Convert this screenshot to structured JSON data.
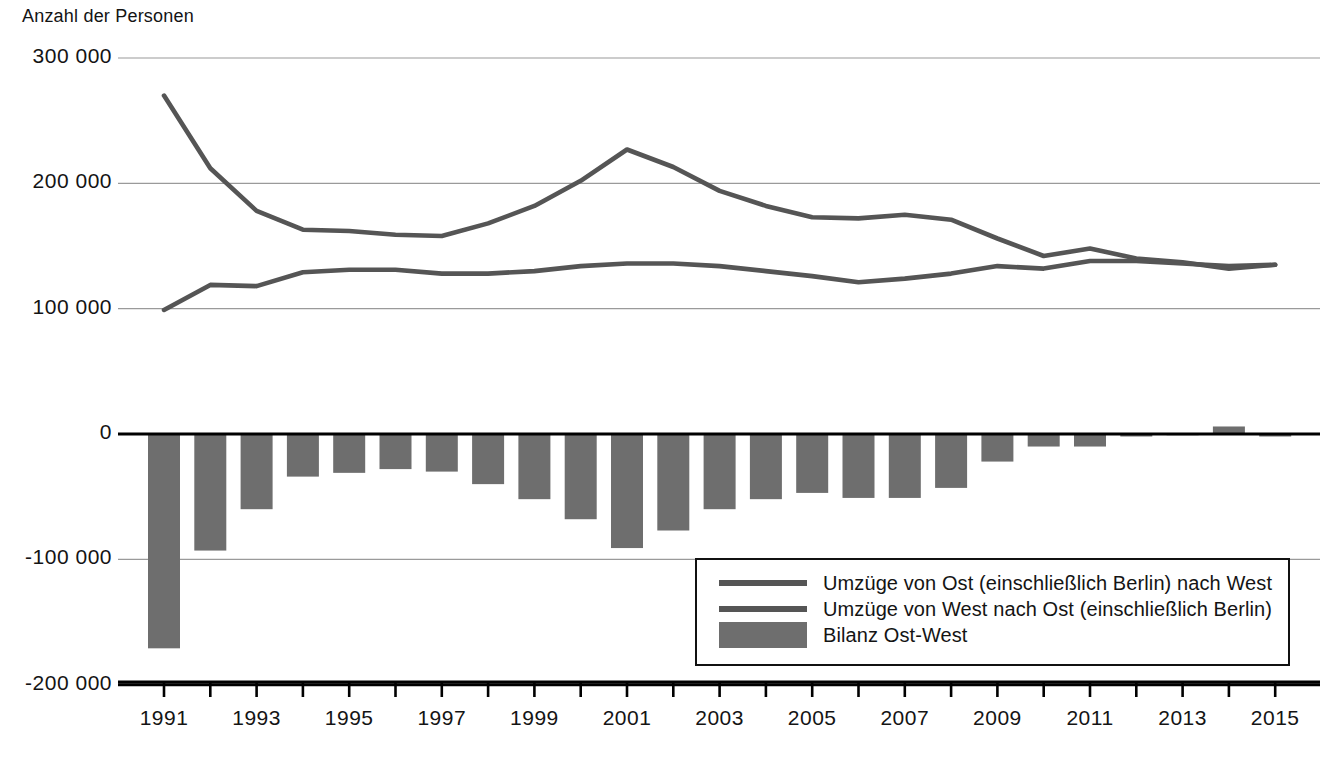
{
  "axis_title": "Anzahl der Personen",
  "legend": {
    "items": [
      {
        "label": "Umzüge von Ost (einschließlich Berlin) nach West",
        "marker": "line",
        "color": "#555555"
      },
      {
        "label": "Umzüge von West nach Ost (einschließlich Berlin)",
        "marker": "line",
        "color": "#555555"
      },
      {
        "label": "Bilanz Ost-West",
        "marker": "bar",
        "color": "#6e6e6e"
      }
    ]
  },
  "colors": {
    "line_ost_west": "#555555",
    "line_west_ost": "#555555",
    "bar_bilanz": "#6e6e6e",
    "gridline": "#9a9a9a",
    "axis": "#000000",
    "text": "#141414"
  },
  "chart_data": {
    "type": "line",
    "title": "",
    "subtitle": "",
    "xlabel": "",
    "ylabel": "Anzahl der Personen",
    "grid": true,
    "legend_position": "bottom-right",
    "ylim": [
      -200000,
      300000
    ],
    "ytick_values": [
      300000,
      200000,
      100000,
      0,
      -100000,
      -200000
    ],
    "ytick_labels": [
      "300 000",
      "200 000",
      "100 000",
      "0",
      "-100 000",
      "-200 000"
    ],
    "x": [
      1991,
      1992,
      1993,
      1994,
      1995,
      1996,
      1997,
      1998,
      1999,
      2000,
      2001,
      2002,
      2003,
      2004,
      2005,
      2006,
      2007,
      2008,
      2009,
      2010,
      2011,
      2012,
      2013,
      2014,
      2015
    ],
    "xtick_labels": [
      "1991",
      "",
      "1993",
      "",
      "1995",
      "",
      "1997",
      "",
      "1999",
      "",
      "2001",
      "",
      "2003",
      "",
      "2005",
      "",
      "2007",
      "",
      "2009",
      "",
      "2011",
      "",
      "2013",
      "",
      "2015"
    ],
    "series": [
      {
        "name": "Umzüge von Ost (einschließlich Berlin) nach West",
        "type": "line",
        "color": "#555555",
        "values": [
          270000,
          212000,
          178000,
          163000,
          162000,
          159000,
          158000,
          168000,
          182000,
          202000,
          227000,
          213000,
          194000,
          182000,
          173000,
          172000,
          175000,
          171000,
          156000,
          142000,
          148000,
          140000,
          137000,
          132000,
          135000
        ]
      },
      {
        "name": "Umzüge von West nach Ost (einschließlich Berlin)",
        "type": "line",
        "color": "#555555",
        "values": [
          99000,
          119000,
          118000,
          129000,
          131000,
          131000,
          128000,
          128000,
          130000,
          134000,
          136000,
          136000,
          134000,
          130000,
          126000,
          121000,
          124000,
          128000,
          134000,
          132000,
          138000,
          138000,
          136000,
          134000,
          135000
        ]
      },
      {
        "name": "Bilanz Ost-West",
        "type": "bar",
        "color": "#6e6e6e",
        "values": [
          -171000,
          -93000,
          -60000,
          -34000,
          -31000,
          -28000,
          -30000,
          -40000,
          -52000,
          -68000,
          -91000,
          -77000,
          -60000,
          -52000,
          -47000,
          -51000,
          -51000,
          -43000,
          -22000,
          -10000,
          -10000,
          -2000,
          -1000,
          6000,
          -2000
        ]
      }
    ]
  }
}
